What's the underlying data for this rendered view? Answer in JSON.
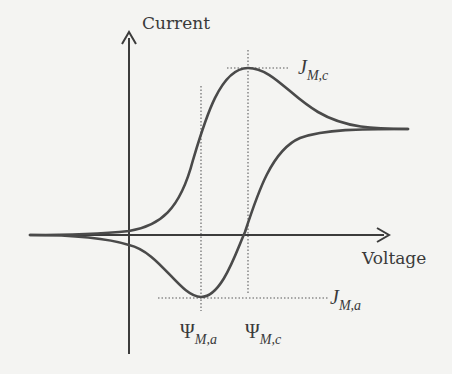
{
  "figure": {
    "type": "cyclic-voltammogram",
    "axes": {
      "x_label": "Voltage",
      "y_label": "Current"
    },
    "annotations": {
      "cathodic_peak_current": {
        "symbol": "J",
        "subscript": "M,c"
      },
      "anodic_peak_current": {
        "symbol": "J",
        "subscript": "M,a"
      },
      "anodic_peak_potential": {
        "symbol": "Ψ",
        "subscript": "M,a"
      },
      "cathodic_peak_potential": {
        "symbol": "Ψ",
        "subscript": "M,c"
      }
    },
    "colors": {
      "curve": "#4a4a4a",
      "axis": "#3c3c3c",
      "guide": "#8a8a8a",
      "background": "#f4f4f2"
    }
  }
}
